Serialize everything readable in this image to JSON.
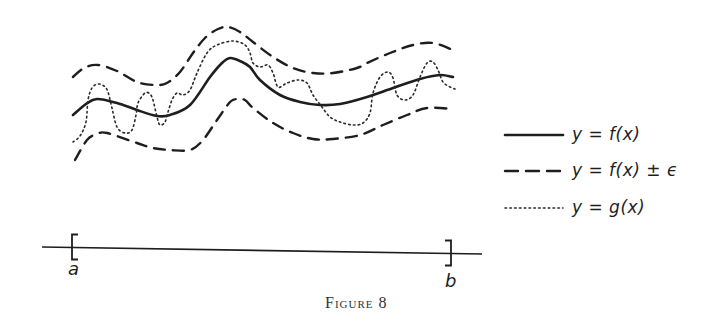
{
  "caption": "Figure 8",
  "endpoints": {
    "a_label": "a",
    "b_label": "b"
  },
  "legend": {
    "items": [
      {
        "style": "solid",
        "label": "y = f(x)"
      },
      {
        "style": "dashed",
        "label": "y = f(x) ± ϵ"
      },
      {
        "style": "dotted",
        "label": "y = g(x)"
      }
    ]
  },
  "colors": {
    "ink": "#1e1e1e",
    "background": "#ffffff"
  },
  "chart_data": {
    "type": "line",
    "title": "Figure 8",
    "xlabel": "",
    "ylabel": "",
    "interval": {
      "start": "a",
      "end": "b"
    },
    "grid": false,
    "legend_position": "right",
    "series": [
      {
        "name": "y = f(x)",
        "style": "solid",
        "points": [
          [
            73,
            115
          ],
          [
            86,
            104
          ],
          [
            97,
            99
          ],
          [
            117,
            103
          ],
          [
            137,
            110
          ],
          [
            157,
            116
          ],
          [
            170,
            115
          ],
          [
            190,
            105
          ],
          [
            210,
            77
          ],
          [
            222,
            63
          ],
          [
            230,
            58
          ],
          [
            240,
            61
          ],
          [
            250,
            67
          ],
          [
            260,
            80
          ],
          [
            280,
            95
          ],
          [
            300,
            102
          ],
          [
            320,
            105
          ],
          [
            340,
            104
          ],
          [
            367,
            97
          ],
          [
            393,
            88
          ],
          [
            420,
            79
          ],
          [
            440,
            75
          ],
          [
            453,
            77
          ]
        ]
      },
      {
        "name": "y = f(x) + ϵ",
        "style": "dashed",
        "points": [
          [
            73,
            77
          ],
          [
            84,
            68
          ],
          [
            98,
            65
          ],
          [
            117,
            71
          ],
          [
            137,
            82
          ],
          [
            155,
            85
          ],
          [
            167,
            83
          ],
          [
            180,
            72
          ],
          [
            193,
            53
          ],
          [
            205,
            38
          ],
          [
            218,
            29
          ],
          [
            228,
            27
          ],
          [
            240,
            32
          ],
          [
            253,
            42
          ],
          [
            273,
            57
          ],
          [
            293,
            68
          ],
          [
            313,
            73
          ],
          [
            333,
            73
          ],
          [
            357,
            68
          ],
          [
            367,
            63
          ],
          [
            390,
            53
          ],
          [
            413,
            45
          ],
          [
            433,
            43
          ],
          [
            453,
            50
          ]
        ]
      },
      {
        "name": "y = f(x) − ϵ",
        "style": "dashed",
        "points": [
          [
            75,
            160
          ],
          [
            87,
            140
          ],
          [
            97,
            134
          ],
          [
            107,
            133
          ],
          [
            137,
            143
          ],
          [
            153,
            148
          ],
          [
            170,
            150
          ],
          [
            190,
            150
          ],
          [
            203,
            140
          ],
          [
            217,
            120
          ],
          [
            230,
            102
          ],
          [
            237,
            99
          ],
          [
            245,
            100
          ],
          [
            253,
            108
          ],
          [
            273,
            123
          ],
          [
            293,
            133
          ],
          [
            313,
            139
          ],
          [
            333,
            139
          ],
          [
            360,
            135
          ],
          [
            383,
            125
          ],
          [
            407,
            115
          ],
          [
            427,
            108
          ],
          [
            453,
            109
          ]
        ]
      },
      {
        "name": "y = g(x)",
        "style": "dotted",
        "points": [
          [
            73,
            142
          ],
          [
            80,
            136
          ],
          [
            86,
            122
          ],
          [
            88,
            100
          ],
          [
            92,
            88
          ],
          [
            98,
            84
          ],
          [
            104,
            86
          ],
          [
            108,
            92
          ],
          [
            112,
            108
          ],
          [
            117,
            127
          ],
          [
            125,
            133
          ],
          [
            132,
            130
          ],
          [
            136,
            115
          ],
          [
            138,
            103
          ],
          [
            145,
            93
          ],
          [
            150,
            94
          ],
          [
            153,
            100
          ],
          [
            157,
            117
          ],
          [
            160,
            125
          ],
          [
            165,
            122
          ],
          [
            168,
            112
          ],
          [
            172,
            100
          ],
          [
            177,
            93
          ],
          [
            183,
            95
          ],
          [
            190,
            90
          ],
          [
            197,
            73
          ],
          [
            207,
            53
          ],
          [
            217,
            45
          ],
          [
            233,
            41
          ],
          [
            245,
            45
          ],
          [
            250,
            53
          ],
          [
            253,
            63
          ],
          [
            260,
            67
          ],
          [
            268,
            65
          ],
          [
            273,
            73
          ],
          [
            278,
            87
          ],
          [
            287,
            83
          ],
          [
            298,
            80
          ],
          [
            307,
            83
          ],
          [
            313,
            95
          ],
          [
            322,
            107
          ],
          [
            330,
            117
          ],
          [
            340,
            122
          ],
          [
            353,
            125
          ],
          [
            363,
            123
          ],
          [
            370,
            113
          ],
          [
            373,
            93
          ],
          [
            380,
            77
          ],
          [
            388,
            72
          ],
          [
            393,
            78
          ],
          [
            397,
            95
          ],
          [
            405,
            100
          ],
          [
            413,
            95
          ],
          [
            420,
            77
          ],
          [
            427,
            63
          ],
          [
            433,
            62
          ],
          [
            438,
            70
          ],
          [
            443,
            82
          ],
          [
            450,
            87
          ],
          [
            455,
            89
          ]
        ]
      }
    ],
    "axis": {
      "start": [
        42,
        247
      ],
      "end": [
        482,
        254
      ],
      "a_bracket_x": 72,
      "b_bracket_x": 451
    }
  }
}
